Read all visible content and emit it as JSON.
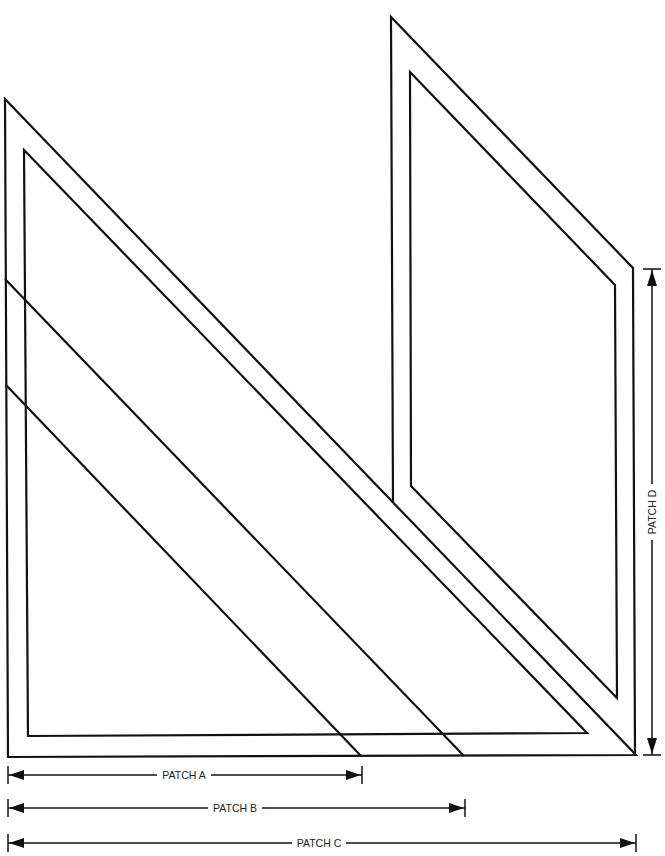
{
  "diagram": {
    "type": "quilt-patch-template",
    "colors": {
      "line": "#111111",
      "background": "#ffffff",
      "label": "#222222"
    },
    "dimensions": [
      {
        "id": "patch_a",
        "label": "PATCH A",
        "orientation": "horizontal"
      },
      {
        "id": "patch_b",
        "label": "PATCH B",
        "orientation": "horizontal"
      },
      {
        "id": "patch_c",
        "label": "PATCH C",
        "orientation": "horizontal"
      },
      {
        "id": "patch_d",
        "label": "PATCH D",
        "orientation": "vertical"
      }
    ]
  },
  "labels": {
    "patch_a": "PATCH A",
    "patch_b": "PATCH B",
    "patch_c": "PATCH C",
    "patch_d": "PATCH D"
  }
}
